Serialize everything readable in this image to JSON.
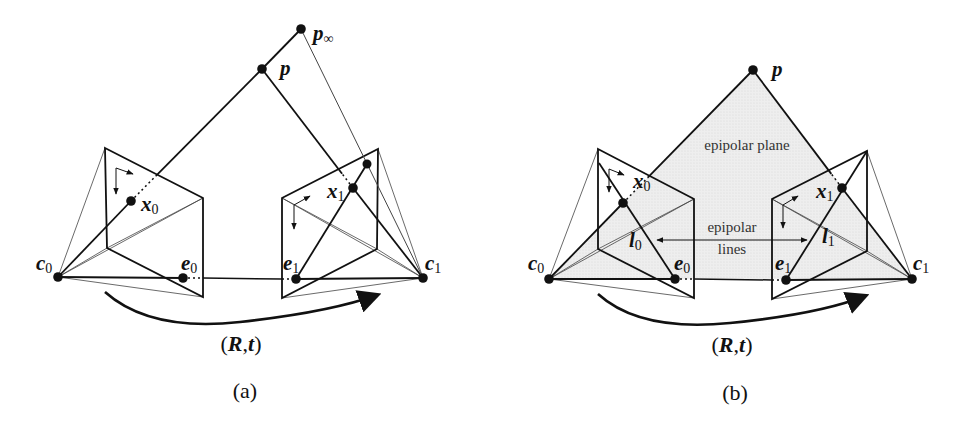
{
  "figure": {
    "panels": [
      {
        "id": "a",
        "caption": "(a)",
        "caption_pos": [
          245,
          398
        ],
        "motion_label": {
          "open": "(",
          "R": "R",
          "comma": ",",
          "t": "t",
          "close": ")",
          "pos": [
            241,
            351
          ]
        },
        "shaded_epipolar_plane": false,
        "points": {
          "c0": [
            58,
            277
          ],
          "c1": [
            423,
            278
          ],
          "e0": [
            183,
            278
          ],
          "e1": [
            296,
            279
          ],
          "x0": [
            131,
            201
          ],
          "x1": [
            353,
            188
          ],
          "p": [
            262,
            69
          ],
          "p_inf": [
            301,
            29
          ],
          "x_inf": [
            367,
            164
          ]
        },
        "left_plane": [
          [
            105,
            148
          ],
          [
            203,
            198
          ],
          [
            203,
            297
          ],
          [
            107,
            248
          ]
        ],
        "right_plane": [
          [
            282,
            198
          ],
          [
            378,
            149
          ],
          [
            377,
            249
          ],
          [
            282,
            298
          ]
        ],
        "left_axis": {
          "origin": [
            116,
            168
          ],
          "down": [
            116,
            194
          ],
          "right": [
            133,
            174
          ]
        },
        "right_axis": {
          "origin": [
            294,
            205
          ],
          "down": [
            294,
            229
          ],
          "right": [
            310,
            196
          ]
        },
        "arc": {
          "start": [
            105,
            292
          ],
          "ctrl": [
            150,
            330
          ],
          "mid": [
            240,
            322
          ],
          "end": [
            377,
            295
          ]
        },
        "labels": [
          {
            "key": "p_inf",
            "main": "p",
            "sub": "∞",
            "pos": [
              313,
              40
            ]
          },
          {
            "key": "p",
            "main": "p",
            "sub": "",
            "pos": [
              280,
              75
            ]
          },
          {
            "key": "x0",
            "main": "x",
            "sub": "0",
            "pos": [
              141,
              211
            ]
          },
          {
            "key": "x1",
            "main": "x",
            "sub": "1",
            "pos": [
              327,
              198
            ]
          },
          {
            "key": "c0",
            "main": "c",
            "sub": "0",
            "pos": [
              36,
              270
            ]
          },
          {
            "key": "e0",
            "main": "e",
            "sub": "0",
            "pos": [
              181,
              270
            ]
          },
          {
            "key": "e1",
            "main": "e",
            "sub": "1",
            "pos": [
              283,
              270
            ]
          },
          {
            "key": "c1",
            "main": "c",
            "sub": "1",
            "pos": [
              425,
              270
            ]
          }
        ],
        "texts": []
      },
      {
        "id": "b",
        "caption": "(b)",
        "caption_pos": [
          735,
          400
        ],
        "motion_label": {
          "open": "(",
          "R": "R",
          "comma": ",",
          "t": "t",
          "close": ")",
          "pos": [
            732,
            352
          ]
        },
        "shaded_epipolar_plane": true,
        "points": {
          "c0": [
            549,
            279
          ],
          "c1": [
            912,
            279
          ],
          "e0": [
            675,
            279
          ],
          "e1": [
            786,
            280
          ],
          "x0": [
            623,
            203
          ],
          "x1": [
            842,
            188
          ],
          "p": [
            753,
            70
          ]
        },
        "left_plane": [
          [
            598,
            149
          ],
          [
            694,
            199
          ],
          [
            694,
            298
          ],
          [
            598,
            249
          ]
        ],
        "right_plane": [
          [
            772,
            199
          ],
          [
            867,
            151
          ],
          [
            867,
            251
          ],
          [
            772,
            299
          ]
        ],
        "left_axis": {
          "origin": [
            609,
            169
          ],
          "down": [
            609,
            192
          ],
          "right": [
            624,
            175
          ]
        },
        "right_axis": {
          "origin": [
            783,
            205
          ],
          "down": [
            783,
            228
          ],
          "right": [
            798,
            196
          ]
        },
        "epipolar_lines": {
          "l0": [
            [
              599,
              163
            ],
            [
              675,
              279
            ]
          ],
          "l1": [
            [
              786,
              280
            ],
            [
              867,
              151
            ]
          ]
        },
        "double_arrow": {
          "from": [
            657,
            240
          ],
          "to": [
            807,
            240
          ]
        },
        "arc": {
          "start": [
            598,
            294
          ],
          "ctrl": [
            640,
            330
          ],
          "mid": [
            730,
            323
          ],
          "end": [
            865,
            296
          ]
        },
        "labels": [
          {
            "key": "p",
            "main": "p",
            "sub": "",
            "pos": [
              772,
              76
            ]
          },
          {
            "key": "x0",
            "main": "x",
            "sub": "0",
            "pos": [
              633,
              188
            ]
          },
          {
            "key": "x1",
            "main": "x",
            "sub": "1",
            "pos": [
              816,
              198
            ]
          },
          {
            "key": "l0",
            "main": "l",
            "sub": "0",
            "pos": [
              629,
              247
            ]
          },
          {
            "key": "l1",
            "main": "l",
            "sub": "1",
            "pos": [
              822,
              243
            ]
          },
          {
            "key": "c0",
            "main": "c",
            "sub": "0",
            "pos": [
              528,
              270
            ]
          },
          {
            "key": "e0",
            "main": "e",
            "sub": "0",
            "pos": [
              674,
              270
            ]
          },
          {
            "key": "e1",
            "main": "e",
            "sub": "1",
            "pos": [
              775,
              270
            ]
          },
          {
            "key": "c1",
            "main": "c",
            "sub": "1",
            "pos": [
              913,
              270
            ]
          }
        ],
        "texts": [
          {
            "key": "epipolar_plane",
            "text": "epipolar plane",
            "pos": [
              747,
              150
            ]
          },
          {
            "key": "epipolar_lines_1",
            "text": "epipolar",
            "pos": [
              732,
              232
            ]
          },
          {
            "key": "epipolar_lines_2",
            "text": "lines",
            "pos": [
              732,
              254
            ]
          }
        ]
      }
    ],
    "colors": {
      "stroke": "#111111",
      "thin_stroke": "#444444",
      "plane_fill": "#ececec",
      "background": "#ffffff"
    }
  }
}
